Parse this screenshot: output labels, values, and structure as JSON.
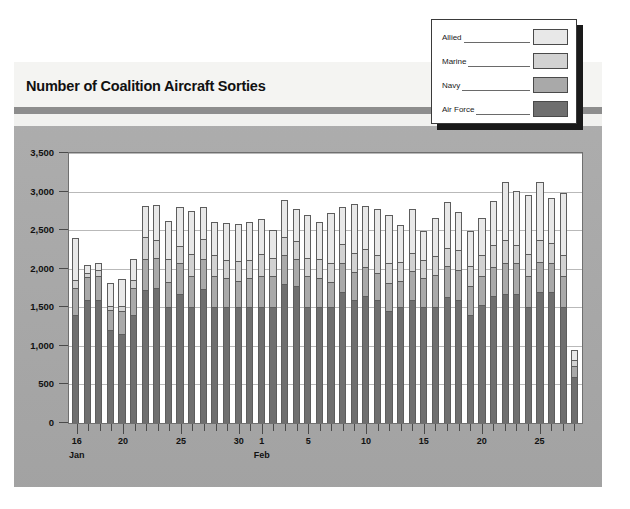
{
  "page_title": "Number of Coalition Aircraft Sorties",
  "legend": {
    "items": [
      {
        "label": "Allied",
        "color": "#e8e8e8"
      },
      {
        "label": "Marine",
        "color": "#d2d2d2"
      },
      {
        "label": "Navy",
        "color": "#a9a9a9"
      },
      {
        "label": "Air Force",
        "color": "#6f6f6f"
      }
    ]
  },
  "colors": {
    "panel_gray": "#a9a9a9",
    "title_rule": "#8d8d8d",
    "plot_background": "#ffffff",
    "gridline": "#b9b9b9",
    "axis": "#4a4a4a"
  },
  "chart_data": {
    "type": "bar",
    "title": "Number of Coalition Aircraft Sorties",
    "stacked": true,
    "xlabel": "",
    "ylabel": "",
    "ylim": [
      0,
      3500
    ],
    "ytick_labels": [
      "0",
      "500",
      "1,000",
      "1,500",
      "2,000",
      "2,500",
      "3,000",
      "3,500"
    ],
    "ytick_values": [
      0,
      500,
      1000,
      1500,
      2000,
      2500,
      3000,
      3500
    ],
    "grid": true,
    "legend_position": "top-right",
    "months": [
      {
        "label": "Jan",
        "at_category": "16"
      },
      {
        "label": "Feb",
        "at_category": "1"
      }
    ],
    "xtick_labeled": [
      "16",
      "20",
      "25",
      "30",
      "1",
      "5",
      "10",
      "15",
      "20",
      "25"
    ],
    "categories": [
      "16",
      "17",
      "18",
      "19",
      "20",
      "21",
      "22",
      "23",
      "24",
      "25",
      "26",
      "27",
      "28",
      "29",
      "30",
      "31",
      "1",
      "2",
      "3",
      "4",
      "5",
      "6",
      "7",
      "8",
      "9",
      "10",
      "11",
      "12",
      "13",
      "14",
      "15",
      "16",
      "17",
      "18",
      "19",
      "20",
      "21",
      "22",
      "23",
      "24",
      "25",
      "26",
      "27",
      "28"
    ],
    "series": [
      {
        "name": "Air Force",
        "color": "#6f6f6f",
        "values": [
          1400,
          1600,
          1600,
          1200,
          1150,
          1400,
          1730,
          1750,
          1500,
          1670,
          1500,
          1740,
          1500,
          1500,
          1500,
          1500,
          1500,
          1500,
          1800,
          1780,
          1500,
          1500,
          1500,
          1700,
          1600,
          1650,
          1600,
          1450,
          1500,
          1600,
          1500,
          1500,
          1630,
          1600,
          1400,
          1530,
          1650,
          1670,
          1670,
          1500,
          1700,
          1700,
          1500,
          600
        ]
      },
      {
        "name": "Navy",
        "color": "#a9a9a9",
        "values": [
          350,
          290,
          300,
          260,
          300,
          350,
          390,
          390,
          330,
          400,
          400,
          380,
          400,
          380,
          340,
          380,
          400,
          400,
          380,
          350,
          400,
          380,
          330,
          370,
          360,
          370,
          350,
          370,
          340,
          370,
          380,
          420,
          400,
          380,
          380,
          380,
          370,
          400,
          400,
          400,
          390,
          370,
          400,
          140
        ]
      },
      {
        "name": "Marine",
        "color": "#d2d2d2",
        "values": [
          100,
          60,
          80,
          60,
          70,
          100,
          290,
          230,
          290,
          230,
          290,
          260,
          280,
          230,
          260,
          230,
          290,
          240,
          230,
          230,
          240,
          250,
          250,
          250,
          250,
          230,
          230,
          250,
          250,
          230,
          230,
          250,
          240,
          260,
          250,
          270,
          290,
          300,
          240,
          290,
          280,
          260,
          280,
          80
        ]
      },
      {
        "name": "Allied",
        "color": "#e8e8e8",
        "values": [
          550,
          100,
          90,
          300,
          350,
          270,
          400,
          450,
          500,
          500,
          560,
          420,
          430,
          480,
          480,
          500,
          450,
          360,
          480,
          420,
          560,
          470,
          640,
          480,
          630,
          560,
          590,
          630,
          480,
          580,
          380,
          490,
          600,
          500,
          460,
          480,
          570,
          750,
          700,
          760,
          750,
          590,
          800,
          130
        ]
      }
    ]
  }
}
